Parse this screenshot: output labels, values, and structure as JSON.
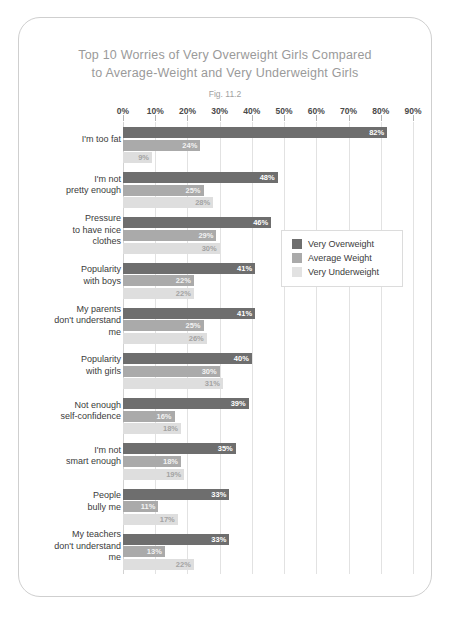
{
  "chart_data": {
    "type": "bar",
    "orientation": "horizontal",
    "title": "Top 10 Worries of Very Overweight Girls Compared to Average-Weight and Very Underweight Girls",
    "title_lines": [
      "Top 10 Worries of Very Overweight Girls Compared",
      "to Average-Weight and Very Underweight Girls"
    ],
    "fig_label": "Fig. 11.2",
    "xlabel": "",
    "ylabel": "",
    "xlim": [
      0,
      90
    ],
    "xtick_labels": [
      "0%",
      "10%",
      "20%",
      "30%",
      "40%",
      "50%",
      "60%",
      "70%",
      "80%",
      "90%"
    ],
    "xticks": [
      0,
      10,
      20,
      30,
      40,
      50,
      60,
      70,
      80,
      90
    ],
    "grid": true,
    "legend_position": "center-right",
    "categories": [
      "I'm too fat",
      "I'm not pretty enough",
      "Pressure to have nice clothes",
      "Popularity with boys",
      "My parents don't understand me",
      "Popularity with girls",
      "Not enough self-confidence",
      "I'm not smart enough",
      "People bully me",
      "My teachers don't understand me"
    ],
    "category_lines": [
      [
        "I'm too fat"
      ],
      [
        "I'm not",
        "pretty enough"
      ],
      [
        "Pressure",
        "to have nice",
        "clothes"
      ],
      [
        "Popularity",
        "with boys"
      ],
      [
        "My parents",
        "don't understand",
        "me"
      ],
      [
        "Popularity",
        "with girls"
      ],
      [
        "Not enough",
        "self-confidence"
      ],
      [
        "I'm not",
        "smart enough"
      ],
      [
        "People",
        "bully me"
      ],
      [
        "My teachers",
        "don't understand",
        "me"
      ]
    ],
    "series": [
      {
        "name": "Very Overweight",
        "color": "#6e6e6e",
        "values": [
          82,
          48,
          46,
          41,
          41,
          40,
          39,
          35,
          33,
          33
        ],
        "labels": [
          "82%",
          "48%",
          "46%",
          "41%",
          "41%",
          "40%",
          "39%",
          "35%",
          "33%",
          "33%"
        ]
      },
      {
        "name": "Average Weight",
        "color": "#aaaaaa",
        "values": [
          24,
          25,
          29,
          22,
          25,
          30,
          16,
          18,
          11,
          13
        ],
        "labels": [
          "24%",
          "25%",
          "29%",
          "22%",
          "25%",
          "30%",
          "16%",
          "18%",
          "11%",
          "13%"
        ]
      },
      {
        "name": "Very Underweight",
        "color": "#dedede",
        "values": [
          9,
          28,
          30,
          22,
          26,
          31,
          18,
          19,
          17,
          22
        ],
        "labels": [
          "9%",
          "28%",
          "30%",
          "22%",
          "26%",
          "31%",
          "18%",
          "19%",
          "17%",
          "22%"
        ]
      }
    ]
  }
}
